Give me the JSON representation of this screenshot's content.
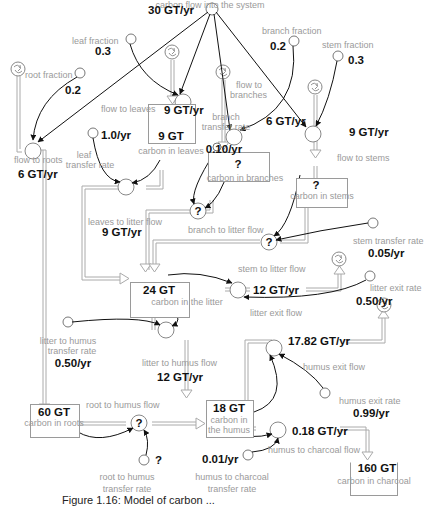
{
  "diagram": {
    "inflow": {
      "label": "carbon flow into the system",
      "value": "30 GT/yr"
    },
    "fractions": {
      "leaf": {
        "label": "leaf fraction",
        "value": "0.3"
      },
      "root": {
        "label": "root fraction",
        "value": "0.2"
      },
      "branch": {
        "label": "branch fraction",
        "value": "0.2"
      },
      "stem": {
        "label": "stem fraction",
        "value": "0.3"
      }
    },
    "flows": {
      "to_leaves": {
        "label": "flow to leaves",
        "value": "9 GT/yr"
      },
      "to_branches": {
        "label": "flow to\nbranches",
        "label_line1": "flow to",
        "label_line2": "branches",
        "value": "6 GT/yr"
      },
      "to_stems": {
        "label": "flow to stems",
        "value": "9 GT/yr"
      },
      "to_roots": {
        "label": "flow to roots",
        "value": "6 GT/yr"
      },
      "leaves_to_litter": {
        "label": "leaves to litter flow",
        "value": "9 GT/yr"
      },
      "branch_to_litter": {
        "label": "branch to litter flow",
        "value": "?"
      },
      "stem_to_litter": {
        "label": "stem to litter flow",
        "value": "?"
      },
      "litter_exit": {
        "label": "litter exit flow",
        "value": "12 GT/yr"
      },
      "litter_to_humus": {
        "label": "litter to humus flow",
        "value": "12 GT/yr"
      },
      "humus_exit": {
        "label": "humus exit flow",
        "value": "17.82 GT/yr"
      },
      "root_to_humus": {
        "label": "root to humus flow",
        "value": "?"
      },
      "humus_to_charcoal": {
        "label": "humus to charcoal flow",
        "value": "0.18 GT/yr"
      }
    },
    "stocks": {
      "leaves": {
        "label": "carbon in leaves",
        "value": "9 GT"
      },
      "branches": {
        "label": "carbon in branches",
        "value": "?"
      },
      "stems": {
        "label": "carbon in stems",
        "value": "?"
      },
      "litter": {
        "label": "carbon in the litter",
        "value": "24 GT"
      },
      "humus": {
        "label_line1": "carbon in",
        "label_line2": "the humus",
        "value": "18 GT"
      },
      "roots": {
        "label": "carbon in roots",
        "value": "60 GT"
      },
      "charcoal": {
        "label": "carbon in charcoal",
        "value": "160 GT"
      }
    },
    "rates": {
      "leaf_transfer": {
        "label_line1": "leaf",
        "label_line2": "transfer rate",
        "value": "1.0/yr"
      },
      "branch_transfer": {
        "label_line1": "branch",
        "label_line2": "transfer rate",
        "value": "0.10/yr"
      },
      "stem_transfer": {
        "label": "stem transfer rate",
        "value": "0.05/yr"
      },
      "litter_exit": {
        "label": "litter exit rate",
        "value": "0.50/yr"
      },
      "litter_to_humus": {
        "label_line1": "litter to humus",
        "label_line2": "transfer rate",
        "value": "0.50/yr"
      },
      "humus_exit": {
        "label": "humus exit rate",
        "value": "0.99/yr"
      },
      "root_to_humus": {
        "label_line1": "root to humus",
        "label_line2": "transfer rate",
        "value": "?"
      },
      "humus_to_charcoal": {
        "label_line1": "humus to charcoal",
        "label_line2": "transfer rate",
        "value": "0.01/yr"
      }
    },
    "caption": "Figure 1.16: Model of carbon ..."
  }
}
